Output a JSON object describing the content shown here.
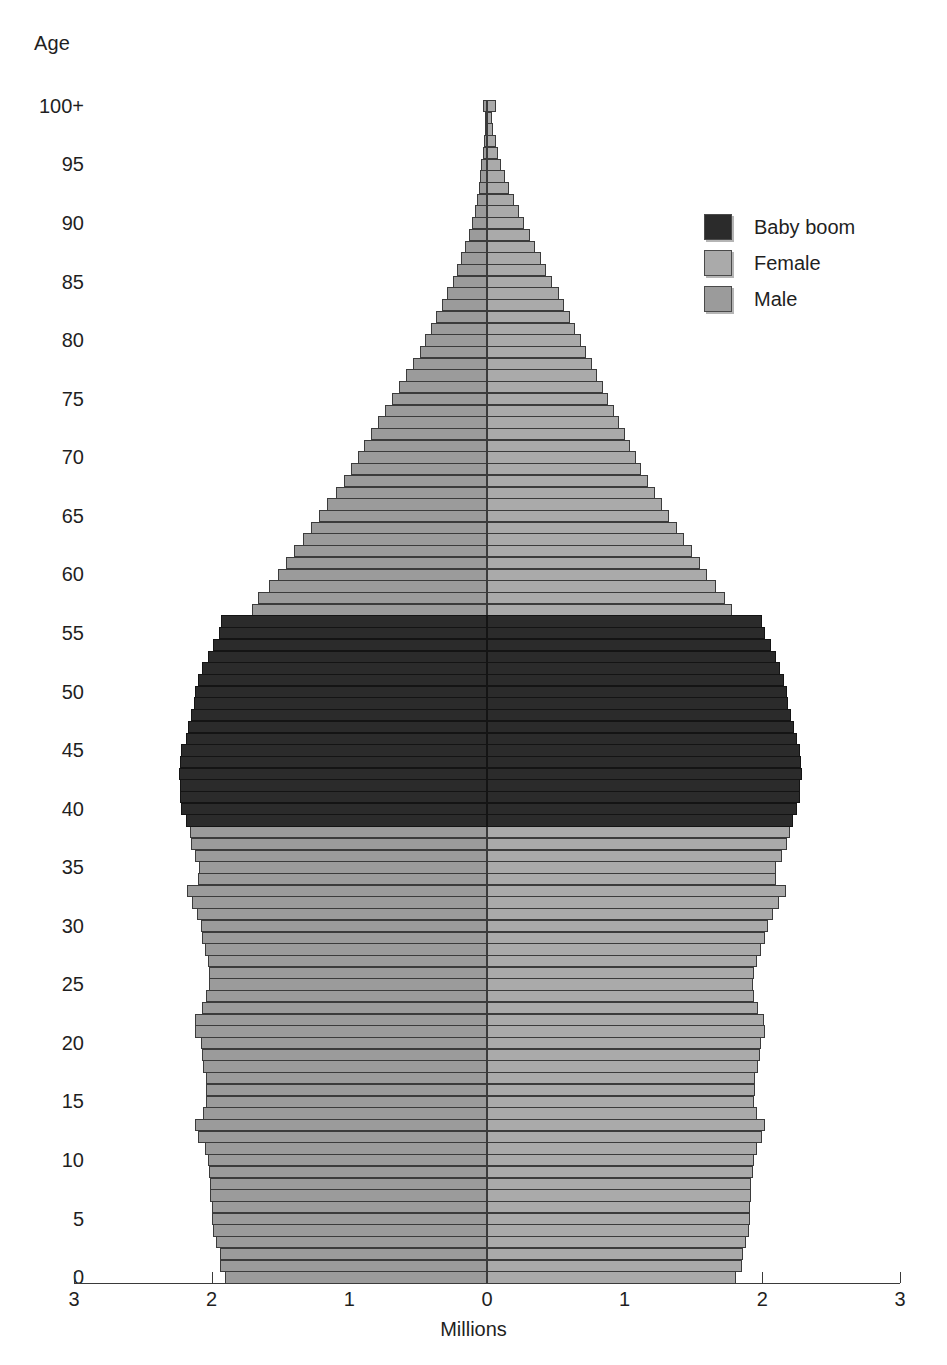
{
  "chart_data": {
    "type": "bar",
    "subtype": "population-pyramid",
    "title": "",
    "xlabel": "Millions",
    "ylabel": "Age",
    "xlim": [
      -3,
      3
    ],
    "ylim": [
      0,
      100
    ],
    "grid": false,
    "legend_position": "upper-right",
    "x_tick_labels": [
      "3",
      "2",
      "1",
      "0",
      "1",
      "2",
      "3"
    ],
    "x_tick_values": [
      -3,
      -2,
      -1,
      0,
      1,
      2,
      3
    ],
    "y_tick_labels": [
      "0",
      "5",
      "10",
      "15",
      "20",
      "25",
      "30",
      "35",
      "40",
      "45",
      "50",
      "55",
      "60",
      "65",
      "70",
      "75",
      "80",
      "85",
      "90",
      "95",
      "100+"
    ],
    "y_tick_values": [
      0,
      5,
      10,
      15,
      20,
      25,
      30,
      35,
      40,
      45,
      50,
      55,
      60,
      65,
      70,
      75,
      80,
      85,
      90,
      95,
      100
    ],
    "colors": {
      "male": "#9b9b9b",
      "female": "#aaaaaa",
      "baby_boom": "#2b2b2b",
      "axis": "#3a3a3a",
      "text": "#1f1f1f",
      "background": "#ffffff"
    },
    "legend": [
      {
        "label": "Baby boom",
        "color": "#2b2b2b",
        "key": "baby_boom"
      },
      {
        "label": "Female",
        "color": "#aaaaaa",
        "key": "female"
      },
      {
        "label": "Male",
        "color": "#9b9b9b",
        "key": "male"
      }
    ],
    "baby_boom_age_range": [
      39,
      56
    ],
    "series": [
      {
        "name": "Male",
        "side": "left",
        "unit": "millions"
      },
      {
        "name": "Female",
        "side": "right",
        "unit": "millions"
      }
    ],
    "ages": [
      0,
      1,
      2,
      3,
      4,
      5,
      6,
      7,
      8,
      9,
      10,
      11,
      12,
      13,
      14,
      15,
      16,
      17,
      18,
      19,
      20,
      21,
      22,
      23,
      24,
      25,
      26,
      27,
      28,
      29,
      30,
      31,
      32,
      33,
      34,
      35,
      36,
      37,
      38,
      39,
      40,
      41,
      42,
      43,
      44,
      45,
      46,
      47,
      48,
      49,
      50,
      51,
      52,
      53,
      54,
      55,
      56,
      57,
      58,
      59,
      60,
      61,
      62,
      63,
      64,
      65,
      66,
      67,
      68,
      69,
      70,
      71,
      72,
      73,
      74,
      75,
      76,
      77,
      78,
      79,
      80,
      81,
      82,
      83,
      84,
      85,
      86,
      87,
      88,
      89,
      90,
      91,
      92,
      93,
      94,
      95,
      96,
      97,
      98,
      99,
      100
    ],
    "male": [
      1.9,
      1.94,
      1.94,
      1.97,
      1.99,
      2.0,
      2.0,
      2.01,
      2.01,
      2.02,
      2.03,
      2.05,
      2.1,
      2.12,
      2.06,
      2.04,
      2.04,
      2.04,
      2.06,
      2.07,
      2.08,
      2.12,
      2.12,
      2.07,
      2.04,
      2.02,
      2.02,
      2.03,
      2.05,
      2.07,
      2.08,
      2.11,
      2.14,
      2.18,
      2.1,
      2.09,
      2.12,
      2.15,
      2.16,
      2.19,
      2.22,
      2.23,
      2.23,
      2.24,
      2.23,
      2.22,
      2.19,
      2.17,
      2.15,
      2.13,
      2.12,
      2.1,
      2.07,
      2.03,
      1.99,
      1.95,
      1.93,
      1.71,
      1.66,
      1.58,
      1.52,
      1.46,
      1.4,
      1.34,
      1.28,
      1.22,
      1.16,
      1.1,
      1.04,
      0.99,
      0.94,
      0.89,
      0.84,
      0.79,
      0.74,
      0.69,
      0.64,
      0.59,
      0.54,
      0.49,
      0.45,
      0.41,
      0.37,
      0.33,
      0.29,
      0.25,
      0.22,
      0.19,
      0.16,
      0.13,
      0.11,
      0.09,
      0.075,
      0.06,
      0.05,
      0.04,
      0.031,
      0.024,
      0.018,
      0.013,
      0.028
    ],
    "female": [
      1.81,
      1.85,
      1.86,
      1.88,
      1.9,
      1.91,
      1.91,
      1.92,
      1.92,
      1.93,
      1.94,
      1.96,
      2.0,
      2.02,
      1.96,
      1.94,
      1.95,
      1.95,
      1.97,
      1.98,
      1.99,
      2.02,
      2.01,
      1.97,
      1.94,
      1.93,
      1.94,
      1.96,
      1.99,
      2.02,
      2.04,
      2.08,
      2.12,
      2.17,
      2.1,
      2.1,
      2.14,
      2.18,
      2.2,
      2.22,
      2.25,
      2.27,
      2.27,
      2.29,
      2.28,
      2.27,
      2.25,
      2.23,
      2.21,
      2.19,
      2.18,
      2.16,
      2.13,
      2.1,
      2.06,
      2.02,
      2.0,
      1.78,
      1.73,
      1.66,
      1.6,
      1.55,
      1.49,
      1.43,
      1.38,
      1.32,
      1.27,
      1.22,
      1.17,
      1.12,
      1.08,
      1.04,
      1.0,
      0.96,
      0.92,
      0.88,
      0.84,
      0.8,
      0.76,
      0.72,
      0.68,
      0.64,
      0.6,
      0.56,
      0.52,
      0.47,
      0.43,
      0.39,
      0.35,
      0.31,
      0.27,
      0.23,
      0.195,
      0.16,
      0.13,
      0.105,
      0.082,
      0.062,
      0.046,
      0.033,
      0.066
    ]
  }
}
